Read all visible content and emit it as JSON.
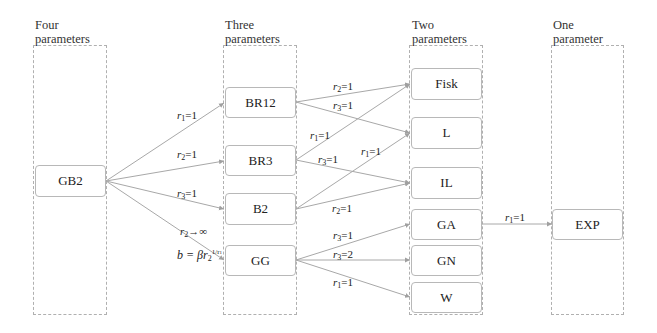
{
  "columns": [
    {
      "id": "four",
      "title_line1": "Four",
      "title_line2": "parameters"
    },
    {
      "id": "three",
      "title_line1": "Three",
      "title_line2": "parameters"
    },
    {
      "id": "two",
      "title_line1": "Two",
      "title_line2": "parameters"
    },
    {
      "id": "one",
      "title_line1": "One",
      "title_line2": "parameter"
    }
  ],
  "nodes": {
    "GB2": "GB2",
    "BR12": "BR12",
    "BR3": "BR3",
    "B2": "B2",
    "GG": "GG",
    "Fisk": "Fisk",
    "L": "L",
    "IL": "IL",
    "GA": "GA",
    "GN": "GN",
    "W": "W",
    "EXP": "EXP"
  },
  "edges": [
    {
      "from": "GB2",
      "to": "BR12",
      "label": {
        "var": "r",
        "sub": "1",
        "rel": "=1"
      }
    },
    {
      "from": "GB2",
      "to": "BR3",
      "label": {
        "var": "r",
        "sub": "2",
        "rel": "=1"
      }
    },
    {
      "from": "GB2",
      "to": "B2",
      "label": {
        "var": "r",
        "sub": "3",
        "rel": "=1"
      }
    },
    {
      "from": "GB2",
      "to": "GG",
      "label": {
        "var": "r",
        "sub": "2",
        "rel": "→∞",
        "extra": "b = βr2^(1/r1)"
      }
    },
    {
      "from": "BR12",
      "to": "Fisk",
      "label": {
        "var": "r",
        "sub": "2",
        "rel": "=1"
      }
    },
    {
      "from": "BR12",
      "to": "L",
      "label": {
        "var": "r",
        "sub": "3",
        "rel": "=1"
      }
    },
    {
      "from": "BR3",
      "to": "Fisk",
      "label": {
        "var": "r",
        "sub": "1",
        "rel": "=1"
      }
    },
    {
      "from": "BR3",
      "to": "IL",
      "label": {
        "var": "r",
        "sub": "3",
        "rel": "=1"
      }
    },
    {
      "from": "B2",
      "to": "L",
      "label": {
        "var": "r",
        "sub": "1",
        "rel": "=1"
      }
    },
    {
      "from": "B2",
      "to": "IL",
      "label": {
        "var": "r",
        "sub": "2",
        "rel": "=1"
      }
    },
    {
      "from": "GG",
      "to": "GA",
      "label": {
        "var": "r",
        "sub": "3",
        "rel": "=1"
      }
    },
    {
      "from": "GG",
      "to": "GN",
      "label": {
        "var": "r",
        "sub": "3",
        "rel": "=2"
      }
    },
    {
      "from": "GG",
      "to": "W",
      "label": {
        "var": "r",
        "sub": "1",
        "rel": "=1"
      }
    },
    {
      "from": "GA",
      "to": "EXP",
      "label": {
        "var": "r",
        "sub": "1",
        "rel": "=1"
      }
    }
  ],
  "labels": {
    "gb2_br12": {
      "v": "r",
      "s": "1",
      "r": "=1"
    },
    "gb2_br3": {
      "v": "r",
      "s": "2",
      "r": "=1"
    },
    "gb2_b2": {
      "v": "r",
      "s": "3",
      "r": "=1"
    },
    "gb2_gg": {
      "v": "r",
      "s": "2",
      "r": "→∞"
    },
    "gb2_gg_b": {
      "pre": "b = β",
      "v": "r",
      "s": "2",
      "sup": "1/r",
      "supsub": "1"
    },
    "br12_fisk": {
      "v": "r",
      "s": "2",
      "r": "=1"
    },
    "br12_l": {
      "v": "r",
      "s": "3",
      "r": "=1"
    },
    "br3_fisk": {
      "v": "r",
      "s": "1",
      "r": "=1"
    },
    "br3_il": {
      "v": "r",
      "s": "3",
      "r": "=1"
    },
    "b2_l": {
      "v": "r",
      "s": "1",
      "r": "=1"
    },
    "b2_il": {
      "v": "r",
      "s": "2",
      "r": "=1"
    },
    "gg_ga": {
      "v": "r",
      "s": "3",
      "r": "=1"
    },
    "gg_gn": {
      "v": "r",
      "s": "3",
      "r": "=2"
    },
    "gg_w": {
      "v": "r",
      "s": "1",
      "r": "=1"
    },
    "ga_exp": {
      "v": "r",
      "s": "1",
      "r": "=1"
    }
  },
  "colors": {
    "edge": "#a8a8a8",
    "node_border": "#b8b8b8",
    "frame_border": "#b0b0b0",
    "text": "#222222"
  }
}
